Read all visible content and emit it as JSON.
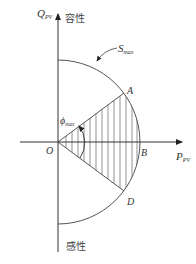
{
  "diagram": {
    "type": "PV inverter capability circle",
    "axes": {
      "y_label": "Q",
      "y_label_sub": "PV",
      "x_label": "P",
      "x_label_sub": "PV",
      "y_positive_label": "容性",
      "y_negative_label": "感性"
    },
    "curve_label": "S",
    "curve_label_sub": "max",
    "angle_label": "ϕ",
    "angle_label_sub": "max",
    "points": {
      "origin": "O",
      "a": "A",
      "b": "B",
      "d": "D"
    },
    "colors": {
      "line": "#444444",
      "background": "#ffffff"
    }
  }
}
